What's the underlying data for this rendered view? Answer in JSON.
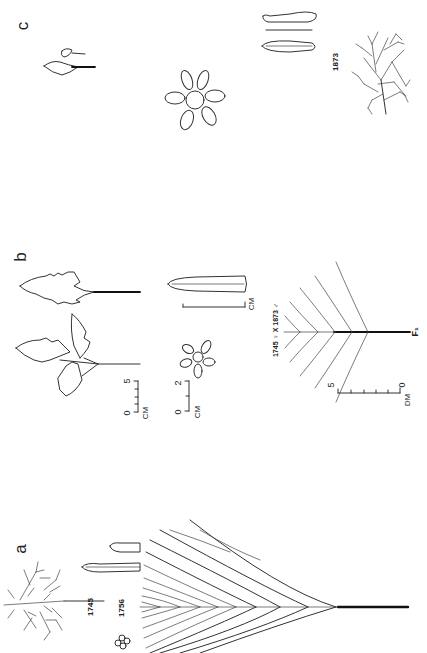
{
  "figure": {
    "background": "#ffffff",
    "ink_color": "#222222",
    "orientation": "rotated 90 degrees counter-clockwise",
    "panels": [
      {
        "id": "a",
        "label": "a",
        "accession_labels": [
          "1745",
          "1756"
        ],
        "contents": [
          "dissected (pinnatifid) leaf",
          "two elongated seed pods",
          "small flower cluster",
          "fan-like branching inflorescence diagram"
        ]
      },
      {
        "id": "b",
        "label": "b",
        "cross_label": "1745 ♀ X 1873 ♂",
        "generation_label": "F₁",
        "contents": [
          "ternate serrated leaf",
          "simple serrated leaf",
          "seed pod",
          "five-petal flower",
          "branching diagram"
        ],
        "scales": [
          {
            "name": "leaf-scale",
            "max_label": "5",
            "zero_label": "0",
            "unit": "CM"
          },
          {
            "name": "flower-scale",
            "max_label": "2",
            "zero_label": "0",
            "unit": "CM"
          },
          {
            "name": "pod-scale",
            "unit": "CM"
          },
          {
            "name": "plant-scale",
            "max_label": "5",
            "zero_label": "0",
            "unit": "DM"
          }
        ]
      },
      {
        "id": "c",
        "label": "c",
        "accession_labels": [
          "1873"
        ],
        "contents": [
          "two small leaves",
          "six-petal flower",
          "two seed pods",
          "bushy branching plant habit"
        ]
      }
    ]
  }
}
